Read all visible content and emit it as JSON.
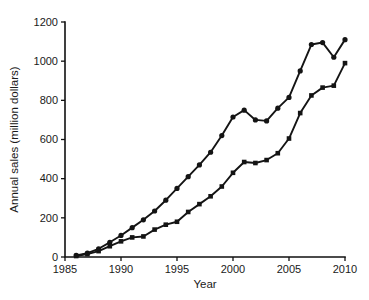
{
  "chart_data": {
    "type": "line",
    "title": "",
    "xlabel": "Year",
    "ylabel": "Annual sales (million dollars)",
    "xlim": [
      1985,
      2010
    ],
    "ylim": [
      0,
      1200
    ],
    "xticks": [
      1985,
      1990,
      1995,
      2000,
      2005,
      2010
    ],
    "xtick_labels": [
      "1985",
      "1990",
      "1995",
      "2000",
      "2005",
      "2010"
    ],
    "yticks": [
      0,
      200,
      400,
      600,
      800,
      1000,
      1200
    ],
    "ytick_labels": [
      "0",
      "200",
      "400",
      "600",
      "800",
      "1000",
      "1200"
    ],
    "grid": false,
    "legend": "none",
    "x": [
      1986,
      1987,
      1988,
      1989,
      1990,
      1991,
      1992,
      1993,
      1994,
      1995,
      1996,
      1997,
      1998,
      1999,
      2000,
      2001,
      2002,
      2003,
      2004,
      2005,
      2006,
      2007,
      2008,
      2009,
      2010
    ],
    "series": [
      {
        "name": "upper-series",
        "marker": "circle",
        "color": "#141414",
        "values": [
          8,
          20,
          42,
          75,
          110,
          150,
          190,
          235,
          290,
          350,
          410,
          470,
          535,
          620,
          715,
          750,
          700,
          695,
          760,
          815,
          950,
          1085,
          1095,
          1020,
          1110
        ]
      },
      {
        "name": "lower-series",
        "marker": "square",
        "color": "#141414",
        "values": [
          5,
          15,
          30,
          55,
          80,
          100,
          105,
          140,
          165,
          180,
          230,
          270,
          310,
          360,
          430,
          485,
          480,
          495,
          530,
          605,
          735,
          825,
          865,
          875,
          990
        ]
      }
    ]
  }
}
